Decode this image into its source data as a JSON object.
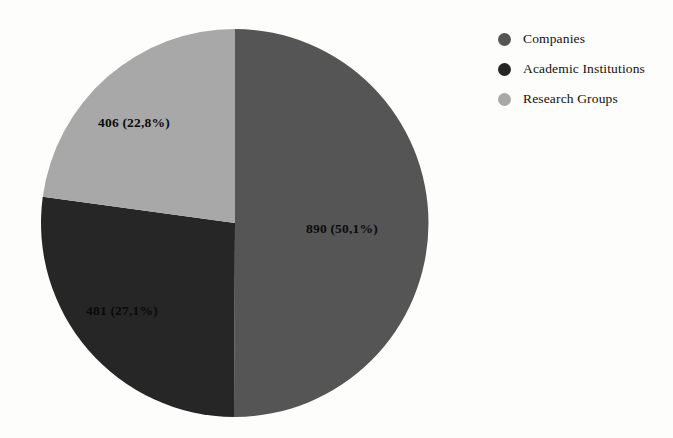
{
  "chart_data": {
    "type": "pie",
    "title": "",
    "subtitle": "",
    "xlabel": "",
    "ylabel": "",
    "grid": false,
    "legend_position": "right-top",
    "decimal_separator": ",",
    "start_angle_oclock": 12,
    "direction": "clockwise",
    "total": 1777,
    "categories": [
      "Companies",
      "Academic Institutions",
      "Research Groups"
    ],
    "values": [
      890,
      481,
      406
    ],
    "percentages": [
      50.1,
      27.1,
      22.8
    ],
    "colors": [
      "#555555",
      "#262626",
      "#a8a8a8"
    ],
    "slices": [
      {
        "label": "Companies",
        "value": 890,
        "percent": 50.1,
        "data_label": "890 (50,1%)",
        "color": "#555555"
      },
      {
        "label": "Academic Institutions",
        "value": 481,
        "percent": 27.1,
        "data_label": "481 (27,1%)",
        "color": "#262626"
      },
      {
        "label": "Research Groups",
        "value": 406,
        "percent": 22.8,
        "data_label": "406 (22,8%)",
        "color": "#a8a8a8"
      }
    ]
  },
  "legend": {
    "items": [
      {
        "label": "Companies",
        "color": "#555555",
        "marker": "circle-marker-icon"
      },
      {
        "label": "Academic Institutions",
        "color": "#262626",
        "marker": "circle-marker-icon"
      },
      {
        "label": "Research Groups",
        "color": "#a8a8a8",
        "marker": "circle-marker-icon"
      }
    ]
  },
  "canvas": {
    "background": "#fdfdfb"
  }
}
